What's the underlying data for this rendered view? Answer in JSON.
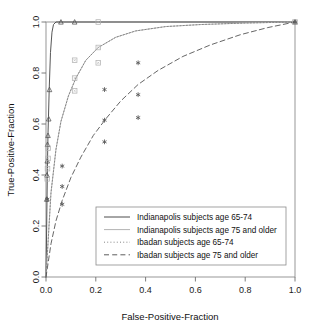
{
  "chart_data": {
    "type": "line",
    "title": "",
    "xlabel": "False-Positive-Fraction",
    "ylabel": "True-Positive-Fraction",
    "xlim": [
      0.0,
      1.0
    ],
    "ylim": [
      0.0,
      1.0
    ],
    "grid": false,
    "legend_position": "bottom-right inside plot",
    "xticks": [
      "0.0",
      "0.2",
      "0.4",
      "0.6",
      "0.8",
      "1.0"
    ],
    "xtick_values": [
      0.0,
      0.2,
      0.4,
      0.6,
      0.8,
      1.0
    ],
    "yticks": [
      "0.0",
      "0.2",
      "0.4",
      "0.6",
      "0.8",
      "1.0"
    ],
    "ytick_values": [
      0.0,
      0.2,
      0.4,
      0.6,
      0.8,
      1.0
    ],
    "series": [
      {
        "name": "Indianapolis subjects age 65-74",
        "style": "solid",
        "color": "#4d4d4d",
        "marker": "triangle",
        "points": [
          [
            0.0,
            0.0
          ],
          [
            0.004,
            0.3
          ],
          [
            0.006,
            0.45
          ],
          [
            0.008,
            0.56
          ],
          [
            0.01,
            0.63
          ],
          [
            0.013,
            0.74
          ],
          [
            0.018,
            0.88
          ],
          [
            0.024,
            0.96
          ],
          [
            0.03,
            0.99
          ],
          [
            0.04,
            1.0
          ],
          [
            0.2,
            1.0
          ],
          [
            0.5,
            1.0
          ],
          [
            1.0,
            1.0
          ]
        ],
        "marker_points": [
          [
            0.003,
            0.305
          ],
          [
            0.004,
            0.4
          ],
          [
            0.005,
            0.455
          ],
          [
            0.006,
            0.52
          ],
          [
            0.008,
            0.555
          ],
          [
            0.011,
            0.62
          ],
          [
            0.014,
            0.735
          ],
          [
            0.06,
            1.0
          ],
          [
            0.115,
            1.0
          ],
          [
            1.0,
            1.0
          ]
        ]
      },
      {
        "name": "Indianapolis subjects age 75 and older",
        "style": "solid",
        "color": "#b3b3b3",
        "marker": "square",
        "points": [
          [
            0.0,
            0.0
          ],
          [
            0.02,
            0.33
          ],
          [
            0.04,
            0.5
          ],
          [
            0.06,
            0.61
          ],
          [
            0.09,
            0.71
          ],
          [
            0.12,
            0.78
          ],
          [
            0.16,
            0.85
          ],
          [
            0.21,
            0.9
          ],
          [
            0.28,
            0.94
          ],
          [
            0.36,
            0.965
          ],
          [
            0.48,
            0.982
          ],
          [
            0.62,
            0.99
          ],
          [
            0.8,
            0.996
          ],
          [
            1.0,
            1.0
          ]
        ],
        "marker_points": [
          [
            0.005,
            0.385
          ],
          [
            0.006,
            0.425
          ],
          [
            0.008,
            0.465
          ],
          [
            0.009,
            0.505
          ],
          [
            0.115,
            0.73
          ],
          [
            0.115,
            0.78
          ],
          [
            0.115,
            0.85
          ],
          [
            0.21,
            0.84
          ],
          [
            0.21,
            0.9
          ],
          [
            0.21,
            1.0
          ],
          [
            1.0,
            1.0
          ]
        ]
      },
      {
        "name": "Ibadan subjects age 65-74",
        "style": "dotted",
        "color": "#808080",
        "marker": "square",
        "points": [
          [
            0.0,
            0.0
          ],
          [
            0.02,
            0.33
          ],
          [
            0.04,
            0.5
          ],
          [
            0.06,
            0.61
          ],
          [
            0.09,
            0.71
          ],
          [
            0.12,
            0.78
          ],
          [
            0.16,
            0.85
          ],
          [
            0.21,
            0.9
          ],
          [
            0.28,
            0.94
          ],
          [
            0.36,
            0.965
          ],
          [
            0.48,
            0.982
          ],
          [
            0.62,
            0.99
          ],
          [
            0.8,
            0.996
          ],
          [
            1.0,
            1.0
          ]
        ],
        "marker_points": []
      },
      {
        "name": "Ibadan subjects age 75 and older",
        "style": "dashed",
        "color": "#555555",
        "marker": "asterisk",
        "points": [
          [
            0.0,
            0.0
          ],
          [
            0.02,
            0.13
          ],
          [
            0.04,
            0.22
          ],
          [
            0.065,
            0.3
          ],
          [
            0.1,
            0.39
          ],
          [
            0.14,
            0.47
          ],
          [
            0.19,
            0.555
          ],
          [
            0.24,
            0.62
          ],
          [
            0.3,
            0.69
          ],
          [
            0.37,
            0.755
          ],
          [
            0.45,
            0.81
          ],
          [
            0.55,
            0.865
          ],
          [
            0.66,
            0.91
          ],
          [
            0.78,
            0.95
          ],
          [
            0.89,
            0.978
          ],
          [
            1.0,
            1.0
          ]
        ],
        "marker_points": [
          [
            0.005,
            0.305
          ],
          [
            0.065,
            0.285
          ],
          [
            0.065,
            0.355
          ],
          [
            0.065,
            0.435
          ],
          [
            0.235,
            0.53
          ],
          [
            0.235,
            0.615
          ],
          [
            0.235,
            0.735
          ],
          [
            0.37,
            0.625
          ],
          [
            0.37,
            0.715
          ],
          [
            0.37,
            0.84
          ],
          [
            1.0,
            1.0
          ]
        ]
      }
    ]
  },
  "legend": {
    "entries": [
      {
        "label": "Indianapolis subjects age 65-74",
        "style": "solid",
        "color": "#4d4d4d"
      },
      {
        "label": "Indianapolis subjects age 75 and older",
        "style": "solid",
        "color": "#b3b3b3"
      },
      {
        "label": "Ibadan subjects age 65-74",
        "style": "dotted",
        "color": "#808080"
      },
      {
        "label": "Ibadan subjects age 75 and older",
        "style": "dashed",
        "color": "#555555"
      }
    ]
  },
  "axes": {
    "x_title": "False-Positive-Fraction",
    "y_title": "True-Positive-Fraction"
  }
}
